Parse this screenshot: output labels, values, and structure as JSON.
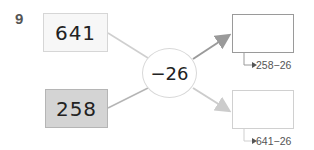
{
  "problem": {
    "number": "9",
    "inputs": [
      {
        "value": "641",
        "fill": "#f7f7f7"
      },
      {
        "value": "258",
        "fill": "#d4d4d4"
      }
    ],
    "operation": "−26",
    "outputs": [
      {
        "value": "",
        "hint": "258−26",
        "border": "#9a9a9a"
      },
      {
        "value": "",
        "hint": "641−26",
        "border": "#d0d0d0"
      }
    ]
  }
}
